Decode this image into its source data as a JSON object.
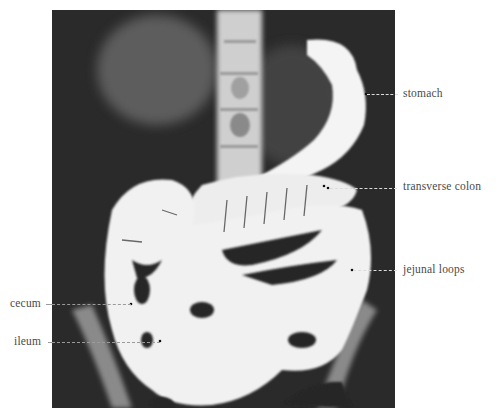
{
  "figure": {
    "image_colors": {
      "background": "#2b2b2b",
      "barium": "#f4f4f4",
      "page": "#ffffff",
      "label_text": "#4a4a4a"
    },
    "labels": [
      {
        "id": "stomach",
        "text": "stomach",
        "side": "right"
      },
      {
        "id": "transverse-colon",
        "text": "transverse colon",
        "side": "right"
      },
      {
        "id": "jejunal-loops",
        "text": "jejunal loops",
        "side": "right"
      },
      {
        "id": "cecum",
        "text": "cecum",
        "side": "left"
      },
      {
        "id": "ileum",
        "text": "ileum",
        "side": "left"
      }
    ]
  }
}
